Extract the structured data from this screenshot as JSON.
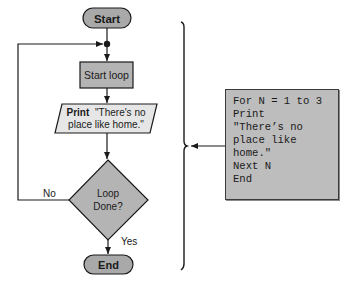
{
  "flowchart": {
    "start_label": "Start",
    "start_loop_label": "Start loop",
    "print_keyword": "Print",
    "print_text_line1": "\"There's no",
    "print_text_line2": "place like home.\"",
    "decision_line1": "Loop",
    "decision_line2": "Done?",
    "no_label": "No",
    "yes_label": "Yes",
    "end_label": "End"
  },
  "code": {
    "lines": [
      "For N = 1 to 3",
      "Print",
      "\"There’s no",
      "place like",
      "home.\"",
      "Next N",
      "End"
    ]
  },
  "colors": {
    "shape_fill": "#b4b4b4",
    "terminal_fill": "#a9a9a9",
    "print_fill": "#e6e6e6",
    "code_fill": "#bdbdbd",
    "stroke": "#1a1a1a"
  }
}
